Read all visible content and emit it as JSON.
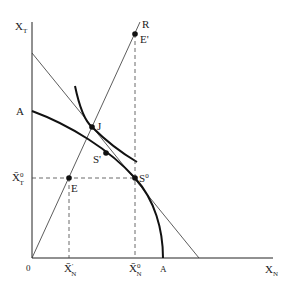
{
  "diagram": {
    "axes": {
      "y_label": "X",
      "y_sub": "T",
      "x_label": "X",
      "x_sub": "N",
      "origin_label": "0"
    },
    "points": {
      "R": "R",
      "E_prime": "E'",
      "J": "J",
      "S_prime": "S'",
      "S0": "S",
      "S0_sup": "0",
      "E": "E"
    },
    "curve_labels": {
      "A_y": "A",
      "A_x": "A"
    },
    "tick_labels": {
      "xt0": "X̄",
      "xt0_sup": "0",
      "xt0_sub": "T",
      "xn1": "X̄",
      "xn1_sup": "'",
      "xn1_sub": "N",
      "xn0": "X̄",
      "xn0_sup": "0",
      "xn0_sub": "N"
    },
    "colors": {
      "ink": "#222222",
      "background": "#ffffff"
    }
  }
}
